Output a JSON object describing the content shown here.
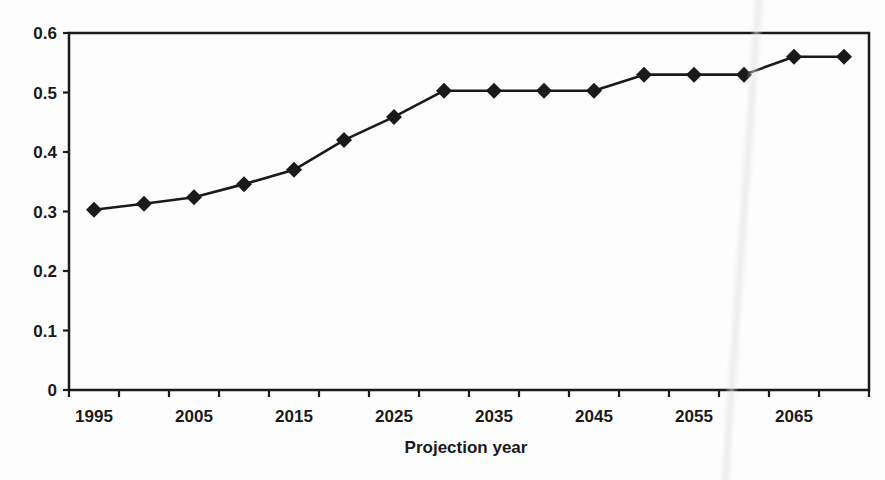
{
  "chart_data": {
    "type": "line",
    "title": "",
    "xlabel": "Projection year",
    "ylabel": "",
    "x": [
      1995,
      2000,
      2005,
      2010,
      2015,
      2020,
      2025,
      2030,
      2035,
      2040,
      2045,
      2050,
      2055,
      2060,
      2065,
      2070
    ],
    "x_tick_labels": [
      "1995",
      "2005",
      "2015",
      "2025",
      "2035",
      "2045",
      "2055",
      "2065"
    ],
    "y_tick_labels": [
      "0",
      "0.1",
      "0.2",
      "0.3",
      "0.4",
      "0.5",
      "0.6"
    ],
    "ylim": [
      0,
      0.6
    ],
    "grid": false,
    "legend": null,
    "series": [
      {
        "name": "Series 1",
        "marker": "diamond",
        "color": "#1a1a1a",
        "values": [
          0.303,
          0.313,
          0.324,
          0.346,
          0.37,
          0.42,
          0.459,
          0.503,
          0.503,
          0.503,
          0.503,
          0.53,
          0.53,
          0.53,
          0.56,
          0.56
        ]
      }
    ]
  }
}
